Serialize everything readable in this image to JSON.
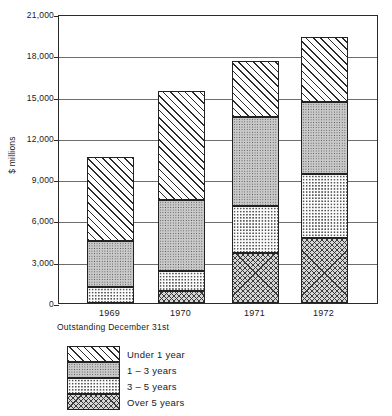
{
  "chart_data": {
    "type": "bar",
    "stacked": true,
    "title": "",
    "xlabel": "Outstanding December 31st",
    "ylabel": "$ millions",
    "categories": [
      "1969",
      "1970",
      "1971",
      "1972"
    ],
    "ylim": [
      0,
      21000
    ],
    "yticks": [
      0,
      3000,
      6000,
      9000,
      12000,
      15000,
      18000,
      21000
    ],
    "ytick_labels": [
      "0",
      "3,000",
      "6,000",
      "9,000",
      "12,000",
      "15,000",
      "18,000",
      "21,000"
    ],
    "grid": true,
    "legend_position": "below-left",
    "series": [
      {
        "name": "Over 5 years",
        "pattern": "crosshatch",
        "values": [
          0,
          880,
          3650,
          4750
        ]
      },
      {
        "name": "3 - 5 years",
        "pattern": "light-dots",
        "values": [
          1150,
          1470,
          3400,
          4650
        ]
      },
      {
        "name": "1 - 3 years",
        "pattern": "gray-dots",
        "values": [
          3350,
          5150,
          6450,
          5200
        ]
      },
      {
        "name": "Under 1 year",
        "pattern": "diagonal-hatch",
        "values": [
          6100,
          7900,
          4100,
          4700
        ]
      }
    ],
    "totals": [
      10600,
      15400,
      17600,
      19300
    ],
    "cumulative_tops": {
      "1969": [
        0,
        1150,
        4500,
        10600
      ],
      "1970": [
        880,
        2350,
        7500,
        15400
      ],
      "1971": [
        3650,
        7050,
        13500,
        17600
      ],
      "1972": [
        4750,
        9400,
        14600,
        19300
      ]
    }
  },
  "axis": {
    "y_title": "$ millions",
    "x_caption": "Outstanding December 31st"
  },
  "legend": {
    "items": [
      {
        "label": "Under 1 year"
      },
      {
        "label": "1 – 3 years"
      },
      {
        "label": "3 – 5 years"
      },
      {
        "label": "Over 5 years"
      }
    ]
  }
}
